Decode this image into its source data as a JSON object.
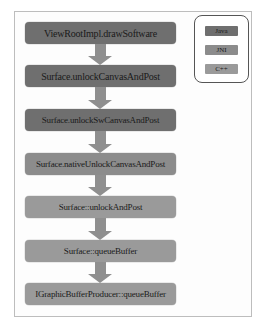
{
  "diagram": {
    "nodes": [
      {
        "label": "ViewRootImpl.drawSoftware",
        "layer": "java"
      },
      {
        "label": "Surface.unlockCanvasAndPost",
        "layer": "java"
      },
      {
        "label": "Surface.unlockSwCanvasAndPost",
        "layer": "java"
      },
      {
        "label": "Surface.nativeUnlockCanvasAndPost",
        "layer": "jni"
      },
      {
        "label": "Surface::unlockAndPost",
        "layer": "cpp"
      },
      {
        "label": "Surface::queueBuffer",
        "layer": "cpp"
      },
      {
        "label": "IGraphicBufferProducer::queueBuffer",
        "layer": "cpp"
      }
    ],
    "edges": [
      {
        "from": 0,
        "to": 1
      },
      {
        "from": 1,
        "to": 2
      },
      {
        "from": 2,
        "to": 3
      },
      {
        "from": 3,
        "to": 4
      },
      {
        "from": 4,
        "to": 5
      },
      {
        "from": 5,
        "to": 6
      }
    ]
  },
  "legend": {
    "items": [
      {
        "label": "Java",
        "color": "#6f6f6f"
      },
      {
        "label": "JNI",
        "color": "#8c8c8c"
      },
      {
        "label": "C++",
        "color": "#9a9a9a"
      }
    ]
  }
}
